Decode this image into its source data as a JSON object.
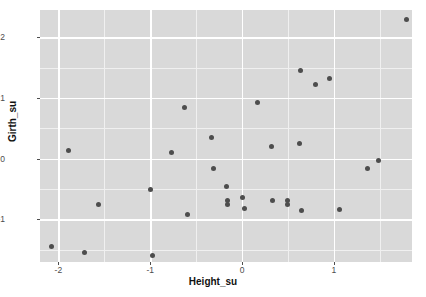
{
  "chart_data": {
    "type": "scatter",
    "title": "",
    "xlabel": "Height_su",
    "ylabel": "Girth_su",
    "xlim": [
      -2.2,
      1.85
    ],
    "ylim": [
      -1.7,
      2.45
    ],
    "xticks": [
      -2,
      -1,
      0,
      1
    ],
    "xtick_labels": [
      "-2",
      "-1",
      "0",
      "1"
    ],
    "yticks": [
      -1,
      0,
      1,
      2
    ],
    "ytick_labels": [
      "-1",
      "0",
      "1",
      "2"
    ],
    "grid": true,
    "minor_grid": true,
    "legend": "none",
    "point_color": "#4d4d4d",
    "panel_color": "#d9d9d9",
    "grid_color": "#ffffff",
    "points": [
      {
        "x": -2.07,
        "y": -1.45
      },
      {
        "x": -1.89,
        "y": 0.14
      },
      {
        "x": -1.72,
        "y": -1.54
      },
      {
        "x": -1.56,
        "y": -0.75
      },
      {
        "x": -1.0,
        "y": -0.5
      },
      {
        "x": -0.98,
        "y": -1.6
      },
      {
        "x": -0.77,
        "y": 0.11
      },
      {
        "x": -0.63,
        "y": 0.85
      },
      {
        "x": -0.59,
        "y": -0.92
      },
      {
        "x": -0.33,
        "y": 0.35
      },
      {
        "x": -0.31,
        "y": -0.16
      },
      {
        "x": -0.17,
        "y": -0.46
      },
      {
        "x": -0.16,
        "y": -0.69
      },
      {
        "x": -0.16,
        "y": -0.75
      },
      {
        "x": 0.0,
        "y": -0.64
      },
      {
        "x": 0.03,
        "y": -0.82
      },
      {
        "x": 0.17,
        "y": 0.92
      },
      {
        "x": 0.32,
        "y": 0.2
      },
      {
        "x": 0.33,
        "y": -0.68
      },
      {
        "x": 0.49,
        "y": -0.68
      },
      {
        "x": 0.49,
        "y": -0.75
      },
      {
        "x": 0.63,
        "y": 0.25
      },
      {
        "x": 0.64,
        "y": 1.45
      },
      {
        "x": 0.65,
        "y": -0.86
      },
      {
        "x": 0.8,
        "y": 1.23
      },
      {
        "x": 0.95,
        "y": 1.33
      },
      {
        "x": 1.06,
        "y": -0.83
      },
      {
        "x": 1.37,
        "y": -0.16
      },
      {
        "x": 1.48,
        "y": -0.03
      },
      {
        "x": 1.79,
        "y": 2.3
      }
    ]
  }
}
